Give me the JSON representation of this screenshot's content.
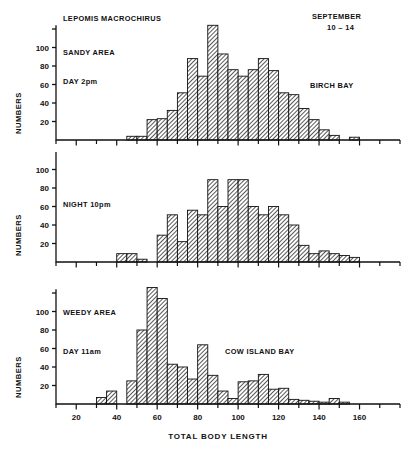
{
  "figure": {
    "title_species": "LEPOMIS MACROCHIRUS",
    "date_line1": "SEPTEMBER",
    "date_line2": "10 – 14",
    "xlabel": "TOTAL BODY LENGTH",
    "ylabel": "NUMBERS",
    "ink_color": "#111111",
    "bar_fill": "#cccccc",
    "background": "#ffffff"
  },
  "chart_data": [
    {
      "type": "bar",
      "panel": "top",
      "title": "LEPOMIS MACROCHIRUS",
      "annotations": [
        "LEPOMIS MACROCHIRUS",
        "SANDY AREA",
        "DAY 2pm",
        "SEPTEMBER",
        "10 – 14",
        "BIRCH BAY"
      ],
      "habitat": "SANDY AREA",
      "time": "DAY 2pm",
      "location": "BIRCH BAY",
      "xlabel": "TOTAL BODY LENGTH",
      "ylabel": "NUMBERS",
      "xlim": [
        10,
        180
      ],
      "ylim": [
        0,
        128
      ],
      "xticks": [
        20,
        40,
        60,
        80,
        100,
        120,
        140,
        160
      ],
      "xminor_step": 10,
      "yticks": [
        20,
        40,
        60,
        80,
        100
      ],
      "yticks_unlabeled": [
        120
      ],
      "grid": false,
      "bin_width": 5,
      "bin_starts": [
        45,
        50,
        55,
        60,
        65,
        70,
        75,
        80,
        85,
        90,
        95,
        100,
        105,
        110,
        115,
        120,
        125,
        130,
        135,
        140,
        145,
        150,
        155
      ],
      "values": [
        4,
        4,
        22,
        23,
        32,
        51,
        88,
        69,
        124,
        93,
        76,
        69,
        76,
        88,
        75,
        51,
        49,
        34,
        22,
        11,
        5,
        0,
        3
      ]
    },
    {
      "type": "bar",
      "panel": "middle",
      "annotations": [
        "NIGHT 10pm"
      ],
      "time": "NIGHT 10pm",
      "xlabel": "TOTAL BODY LENGTH",
      "ylabel": "NUMBERS",
      "xlim": [
        10,
        180
      ],
      "ylim": [
        0,
        128
      ],
      "xticks": [
        20,
        40,
        60,
        80,
        100,
        120,
        140,
        160
      ],
      "xminor_step": 10,
      "yticks": [
        20,
        40,
        60,
        80,
        100
      ],
      "yticks_unlabeled": [
        120
      ],
      "grid": false,
      "bin_width": 5,
      "bin_starts": [
        40,
        45,
        50,
        55,
        60,
        65,
        70,
        75,
        80,
        85,
        90,
        95,
        100,
        105,
        110,
        115,
        120,
        125,
        130,
        135,
        140,
        145,
        150,
        155
      ],
      "values": [
        9,
        9,
        3,
        0,
        29,
        51,
        22,
        56,
        51,
        89,
        60,
        89,
        89,
        60,
        51,
        60,
        51,
        40,
        18,
        9,
        12,
        9,
        7,
        5
      ]
    },
    {
      "type": "bar",
      "panel": "bottom",
      "annotations": [
        "WEEDY AREA",
        "DAY 11am",
        "COW ISLAND BAY"
      ],
      "habitat": "WEEDY AREA",
      "time": "DAY 11am",
      "location": "COW ISLAND BAY",
      "xlabel": "TOTAL BODY LENGTH",
      "ylabel": "NUMBERS",
      "xlim": [
        10,
        180
      ],
      "ylim": [
        0,
        128
      ],
      "xticks": [
        20,
        40,
        60,
        80,
        100,
        120,
        140,
        160
      ],
      "xminor_step": 10,
      "yticks": [
        20,
        40,
        60,
        80,
        100
      ],
      "yticks_unlabeled": [
        120
      ],
      "grid": false,
      "bin_width": 5,
      "bin_starts": [
        30,
        35,
        40,
        45,
        50,
        55,
        60,
        65,
        70,
        75,
        80,
        85,
        90,
        95,
        100,
        105,
        110,
        115,
        120,
        125,
        130,
        135,
        140,
        145,
        150,
        155
      ],
      "values": [
        7,
        14,
        0,
        25,
        80,
        126,
        114,
        43,
        40,
        27,
        64,
        31,
        14,
        6,
        24,
        25,
        32,
        16,
        17,
        5,
        4,
        3,
        2,
        6,
        2,
        0
      ]
    }
  ]
}
